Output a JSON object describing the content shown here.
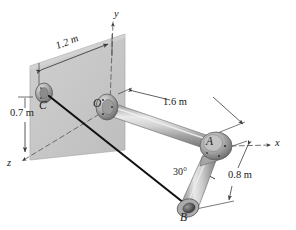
{
  "figure": {
    "background_color": "#ffffff",
    "wall_color": "#c9c9c9",
    "pipe_color": "#b8b8b8",
    "cable_color": "#121212",
    "line_color": "#3a3a3a"
  },
  "axes": [
    {
      "name": "y-axis",
      "label": "y",
      "x": 117,
      "y": 13,
      "direction": "up"
    },
    {
      "name": "x-axis",
      "label": "x",
      "x": 277,
      "y": 144,
      "direction": "right"
    },
    {
      "name": "z-axis",
      "label": "z",
      "x": 9,
      "y": 163,
      "direction": "lower-left"
    }
  ],
  "points": [
    {
      "name": "point-C",
      "label": "C",
      "x": 42,
      "y": 103,
      "note": "cable anchor on wall"
    },
    {
      "name": "point-O",
      "label": "O",
      "x": 98,
      "y": 104,
      "note": "pipe support at wall, origin"
    },
    {
      "name": "point-A",
      "label": "A",
      "x": 211,
      "y": 143,
      "note": "elbow joint, has dot marker"
    },
    {
      "name": "point-B",
      "label": "B",
      "x": 187,
      "y": 213,
      "note": "free end of lower pipe"
    }
  ],
  "dimensions": [
    {
      "name": "dimension-1-2m",
      "label": "1.2 m",
      "x": 54,
      "y": 46,
      "rotation": -26,
      "measures": "C to O along wall"
    },
    {
      "name": "dimension-0-7m",
      "label": "0.7 m",
      "x": 12,
      "y": 114,
      "rotation": 0,
      "measures": "vertical drop to C"
    },
    {
      "name": "dimension-1-6m",
      "label": "1.6 m",
      "x": 178,
      "y": 103,
      "rotation": 0,
      "measures": "O to A pipe length"
    },
    {
      "name": "dimension-0-8m",
      "label": "0.8 m",
      "x": 233,
      "y": 176,
      "rotation": 0,
      "measures": "A to B pipe length"
    }
  ],
  "angles": [
    {
      "name": "angle-30-degrees",
      "label": "30°",
      "x": 180,
      "y": 174,
      "at": "A",
      "between": "lower pipe and vertical"
    }
  ]
}
